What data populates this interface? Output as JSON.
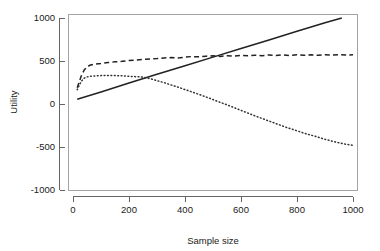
{
  "chart_data": {
    "type": "line",
    "title": "",
    "subtitle": "",
    "xlabel": "Sample size",
    "ylabel": "Utility",
    "xlim": [
      0,
      1000
    ],
    "ylim": [
      -1000,
      1000
    ],
    "xticks": [
      0,
      200,
      400,
      600,
      800,
      1000
    ],
    "yticks": [
      1000,
      500,
      0,
      -500,
      -1000
    ],
    "xtick_labels": [
      "0",
      "200",
      "400",
      "600",
      "800",
      "1000"
    ],
    "ytick_labels": [
      "1000",
      "500",
      "0",
      "-500",
      "-1000"
    ],
    "grid": false,
    "legend": "none",
    "background": "#ffffff",
    "line_color": "#222222",
    "series": [
      {
        "name": "solid-line",
        "linestyle": "solid",
        "color": "#222222",
        "x": [
          15,
          100,
          200,
          300,
          400,
          500,
          600,
          700,
          800,
          900,
          960
        ],
        "values": [
          55,
          140,
          245,
          345,
          445,
          545,
          645,
          745,
          845,
          945,
          1000
        ]
      },
      {
        "name": "dashed-line",
        "linestyle": "dashed",
        "color": "#222222",
        "x": [
          15,
          22,
          30,
          40,
          50,
          60,
          75,
          100,
          125,
          150,
          175,
          200,
          225,
          250,
          275,
          300,
          325,
          350,
          375,
          400,
          425,
          450,
          475,
          500,
          525,
          550,
          575,
          600,
          625,
          650,
          675,
          700,
          725,
          750,
          775,
          800,
          825,
          850,
          875,
          900,
          925,
          950,
          975,
          1000
        ],
        "values": [
          190,
          255,
          330,
          395,
          430,
          450,
          462,
          470,
          482,
          490,
          496,
          505,
          512,
          518,
          523,
          528,
          536,
          540,
          536,
          545,
          552,
          548,
          556,
          560,
          553,
          562,
          558,
          566,
          560,
          568,
          562,
          570,
          563,
          571,
          564,
          572,
          566,
          573,
          567,
          574,
          568,
          575,
          569,
          572
        ]
      },
      {
        "name": "dotted-line",
        "linestyle": "dotted",
        "color": "#333333",
        "x": [
          15,
          22,
          30,
          40,
          50,
          60,
          75,
          100,
          125,
          150,
          175,
          200,
          225,
          250,
          275,
          300,
          325,
          350,
          375,
          400,
          425,
          450,
          475,
          500,
          525,
          550,
          575,
          600,
          625,
          650,
          675,
          700,
          725,
          750,
          775,
          800,
          825,
          850,
          875,
          900,
          925,
          950,
          975,
          1000
        ],
        "values": [
          165,
          215,
          265,
          300,
          315,
          322,
          326,
          330,
          332,
          330,
          328,
          322,
          318,
          312,
          295,
          272,
          248,
          222,
          196,
          168,
          140,
          112,
          82,
          52,
          20,
          -10,
          -42,
          -74,
          -106,
          -138,
          -168,
          -198,
          -228,
          -258,
          -286,
          -312,
          -338,
          -362,
          -386,
          -410,
          -432,
          -452,
          -468,
          -480
        ]
      }
    ]
  }
}
